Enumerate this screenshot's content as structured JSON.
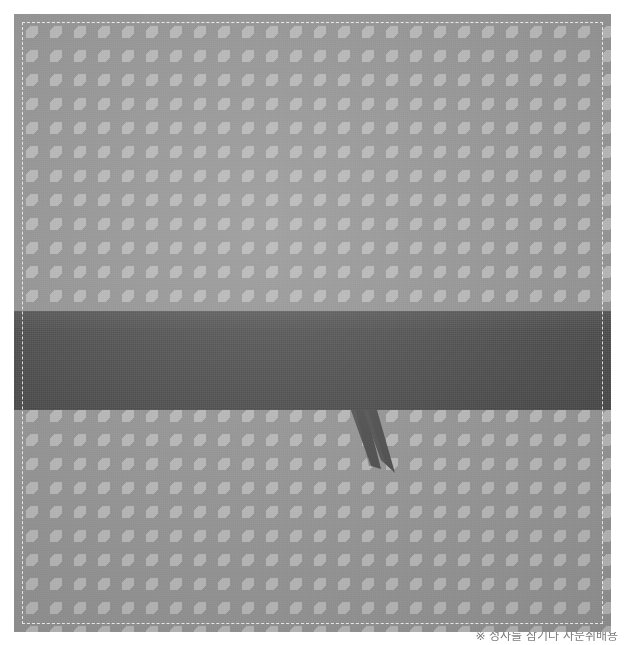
{
  "image": {
    "subject": "houndstooth-patterned fabric textile with dark band and ribbon tails",
    "alt_text": "Gray houndstooth fabric swatch with a dark charcoal horizontal band and two tapered ribbon tails",
    "width": 624,
    "height": 645
  },
  "fabric": {
    "pattern_name": "houndstooth",
    "pattern_repeat_px": 24,
    "light_tone": "#b6b6b6",
    "mid_tone": "#939393",
    "sheet_left": 14,
    "sheet_top": 14,
    "sheet_width": 597,
    "sheet_height": 618
  },
  "stitch_border": {
    "label": "dashed stitched hem",
    "color": "#f6f6f6",
    "style": "dashed",
    "inset_px": 8
  },
  "band": {
    "label": "dark charcoal band",
    "color": "#4c4c4c",
    "top_px": 297,
    "height_px": 99
  },
  "tails": {
    "label": "ribbon tails",
    "color": "#4c4c4c",
    "count": 2,
    "items": [
      {
        "name": "left-ribbon-tail",
        "points": "337,396 352,396 367,455 357,452"
      },
      {
        "name": "right-ribbon-tail",
        "points": "349,396 363,396 381,459 367,446"
      }
    ]
  },
  "caption": {
    "text": "※ 정사를 참기나 사문취배용",
    "note": "caption is clipped by the bottom edge of the image",
    "color": "#7d7d7d"
  }
}
